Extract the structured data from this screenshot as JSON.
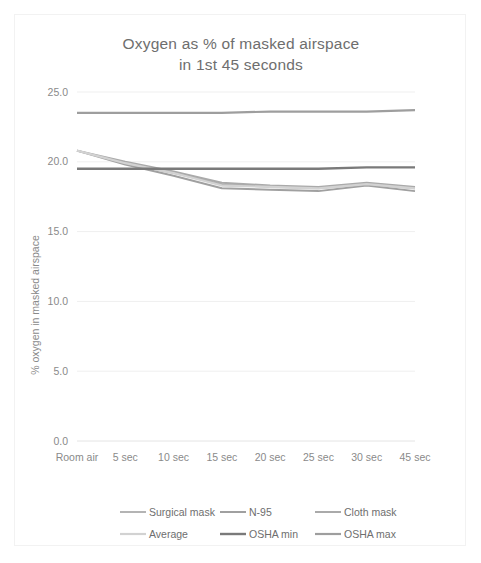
{
  "chart_data": {
    "type": "line",
    "title": "Oxygen as % of masked airspace in 1st 45 seconds",
    "title_line1": "Oxygen as % of masked airspace",
    "title_line2": "in 1st 45 seconds",
    "xlabel": "",
    "ylabel": "% oxygen in masked airspace",
    "categories": [
      "Room air",
      "5 sec",
      "10 sec",
      "15 sec",
      "20 sec",
      "25 sec",
      "30 sec",
      "45 sec"
    ],
    "ylim": [
      0.0,
      25.0
    ],
    "ytick_labels": [
      "0.0",
      "5.0",
      "10.0",
      "15.0",
      "20.0",
      "25.0"
    ],
    "ytick_values": [
      0.0,
      5.0,
      10.0,
      15.0,
      20.0,
      25.0
    ],
    "grid": true,
    "legend_position": "bottom",
    "series": [
      {
        "name": "Surgical mask",
        "color": "#b4b4b4",
        "width": 2.0,
        "values": [
          20.8,
          19.9,
          19.2,
          18.4,
          18.2,
          18.1,
          18.4,
          18.1
        ]
      },
      {
        "name": "N-95",
        "color": "#a0a0a0",
        "width": 2.0,
        "values": [
          20.8,
          19.8,
          19.0,
          18.1,
          18.0,
          17.9,
          18.3,
          17.9
        ]
      },
      {
        "name": "Cloth mask",
        "color": "#aaaaaa",
        "width": 2.0,
        "values": [
          20.8,
          20.0,
          19.3,
          18.5,
          18.3,
          18.2,
          18.5,
          18.2
        ]
      },
      {
        "name": "Average",
        "color": "#d2d2d2",
        "width": 2.2,
        "values": [
          20.8,
          19.9,
          19.2,
          18.3,
          18.2,
          18.1,
          18.4,
          18.1
        ]
      },
      {
        "name": "OSHA min",
        "color": "#7a7a7a",
        "width": 2.4,
        "values": [
          19.5,
          19.5,
          19.5,
          19.5,
          19.5,
          19.5,
          19.6,
          19.6
        ]
      },
      {
        "name": "OSHA max",
        "color": "#9e9e9e",
        "width": 2.2,
        "values": [
          23.5,
          23.5,
          23.5,
          23.5,
          23.6,
          23.6,
          23.6,
          23.7
        ]
      }
    ],
    "legend_rows": [
      [
        "Surgical mask",
        "N-95",
        "Cloth mask"
      ],
      [
        "Average",
        "OSHA min",
        "OSHA max"
      ]
    ]
  }
}
